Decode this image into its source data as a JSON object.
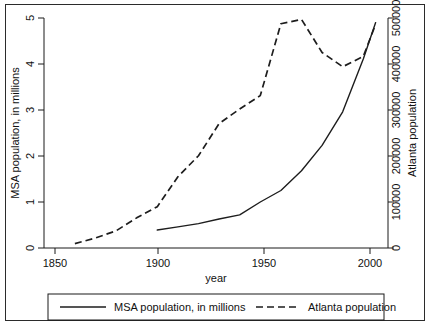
{
  "figure": {
    "name": "atlanta-population-dual-axis-line-chart",
    "has_outer_border": true,
    "background_color": "#ffffff",
    "ink_color": "#1d1d1d"
  },
  "chart_data": {
    "type": "line",
    "title": "",
    "xlabel": "year",
    "ylabel": "MSA population, in millions",
    "y2label": "Atlanta population",
    "xlim": [
      1845,
      2012
    ],
    "ylim": [
      0,
      5
    ],
    "y2lim": [
      0,
      500000
    ],
    "grid": false,
    "legend_position": "below-plot",
    "xticks": [
      1850,
      1900,
      1950,
      2000
    ],
    "xticklabels": [
      "1850",
      "1900",
      "1950",
      "2000"
    ],
    "yticks": [
      0,
      1,
      2,
      3,
      4,
      5
    ],
    "yticklabels": [
      "0",
      "1",
      "2",
      "3",
      "4",
      "5"
    ],
    "y2ticks": [
      0,
      100000,
      200000,
      300000,
      400000,
      500000
    ],
    "y2ticklabels": [
      "0",
      "100000",
      "200000",
      "300000",
      "400000",
      "500000"
    ],
    "series": [
      {
        "name": "MSA population, in millions",
        "axis": "left",
        "style": "solid",
        "color": "#1d1d1d",
        "x": [
          1900,
          1910,
          1920,
          1930,
          1940,
          1950,
          1960,
          1970,
          1980,
          1990,
          2000,
          2006
        ],
        "values": [
          0.39,
          0.46,
          0.53,
          0.63,
          0.72,
          1.0,
          1.25,
          1.68,
          2.23,
          2.96,
          4.11,
          4.9
        ]
      },
      {
        "name": "Atlanta population",
        "axis": "right",
        "style": "dashed",
        "color": "#1d1d1d",
        "x": [
          1860,
          1870,
          1880,
          1890,
          1900,
          1910,
          1920,
          1930,
          1940,
          1950,
          1960,
          1970,
          1980,
          1990,
          2000,
          2006
        ],
        "values": [
          9554,
          21789,
          37409,
          65533,
          89872,
          154839,
          200616,
          270366,
          302288,
          331314,
          487455,
          496973,
          425022,
          394017,
          416474,
          486411
        ]
      }
    ]
  },
  "legend": {
    "entries": [
      {
        "label": "MSA population, in millions",
        "style": "solid"
      },
      {
        "label": "Atlanta population",
        "style": "dashed"
      }
    ]
  }
}
